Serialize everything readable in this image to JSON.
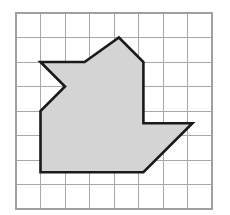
{
  "figure": {
    "background_color": "#ffffff",
    "caption": ""
  },
  "grid": {
    "name": "square-grid",
    "columns": 8,
    "rows": 8,
    "cell_size_px": 24.5,
    "origin_x_px": 16,
    "origin_y_px": 13,
    "width_px": 196,
    "height_px": 196,
    "line_color": "#a8a8a8",
    "border_color": "#a0a0a0",
    "line_width_px": 1,
    "show_grid": true,
    "show_axis_labels": false,
    "tick_labels": []
  },
  "shape": {
    "name": "shaded-polygon",
    "type": "polygon",
    "fill_color": "#d4d4d4",
    "stroke_color": "#1a1a1a",
    "stroke_width_px": 2.6,
    "vertex_count": 10,
    "vertices_grid_units": [
      [
        1.0,
        2.0
      ],
      [
        2.0,
        3.0
      ],
      [
        1.0,
        4.0
      ],
      [
        1.0,
        6.5
      ],
      [
        5.2,
        6.5
      ],
      [
        7.2,
        4.5
      ],
      [
        5.2,
        4.5
      ],
      [
        5.2,
        2.0
      ],
      [
        4.2,
        1.0
      ],
      [
        2.8,
        2.0
      ]
    ],
    "vertices_px": [
      [
        40.5,
        62.0
      ],
      [
        65.0,
        86.5
      ],
      [
        40.5,
        111.0
      ],
      [
        40.5,
        172.2
      ],
      [
        143.4,
        172.2
      ],
      [
        192.4,
        123.2
      ],
      [
        143.4,
        123.2
      ],
      [
        143.4,
        62.0
      ],
      [
        118.9,
        37.5
      ],
      [
        84.6,
        62.0
      ]
    ],
    "points_attr": "40.5,62.0 65.0,86.5 40.5,111.0 40.5,172.2 143.4,172.2 192.4,123.2 143.4,123.2 143.4,62.0 118.9,37.5 84.6,62.0"
  }
}
